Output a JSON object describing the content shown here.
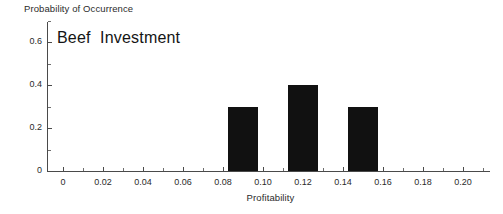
{
  "chart_data": {
    "type": "bar",
    "title": "Beef  Investment",
    "xlabel": "Profitability",
    "ylabel": "Probability of Occurrence",
    "x": [
      0.09,
      0.12,
      0.15
    ],
    "values": [
      0.3,
      0.4,
      0.3
    ],
    "bar_width": 0.0075,
    "xlim": [
      -0.008,
      0.2135
    ],
    "ylim": [
      0,
      0.7
    ],
    "grid": false,
    "legend": null,
    "bar_color": "#111111",
    "axis_color": "#4a4a4a",
    "x_ticks": [
      {
        "value": 0,
        "label": "0",
        "major": true
      },
      {
        "value": 0.01,
        "label": "",
        "major": false
      },
      {
        "value": 0.02,
        "label": "0.02",
        "major": true
      },
      {
        "value": 0.03,
        "label": "",
        "major": false
      },
      {
        "value": 0.04,
        "label": "0.04",
        "major": true
      },
      {
        "value": 0.05,
        "label": "",
        "major": false
      },
      {
        "value": 0.06,
        "label": "0.06",
        "major": true
      },
      {
        "value": 0.07,
        "label": "",
        "major": false
      },
      {
        "value": 0.08,
        "label": "0.08",
        "major": true
      },
      {
        "value": 0.09,
        "label": "",
        "major": false
      },
      {
        "value": 0.1,
        "label": "0.10",
        "major": true
      },
      {
        "value": 0.11,
        "label": "",
        "major": false
      },
      {
        "value": 0.12,
        "label": "0.12",
        "major": true
      },
      {
        "value": 0.13,
        "label": "",
        "major": false
      },
      {
        "value": 0.14,
        "label": "0.14",
        "major": true
      },
      {
        "value": 0.15,
        "label": "",
        "major": false
      },
      {
        "value": 0.16,
        "label": "0.16",
        "major": true
      },
      {
        "value": 0.17,
        "label": "",
        "major": false
      },
      {
        "value": 0.18,
        "label": "0.18",
        "major": true
      },
      {
        "value": 0.19,
        "label": "",
        "major": false
      },
      {
        "value": 0.2,
        "label": "0.20",
        "major": true
      },
      {
        "value": 0.21,
        "label": "",
        "major": false
      }
    ],
    "y_ticks": [
      {
        "value": 0,
        "label": "0",
        "major": true
      },
      {
        "value": 0.1,
        "label": "",
        "major": false
      },
      {
        "value": 0.2,
        "label": "0.2",
        "major": true
      },
      {
        "value": 0.3,
        "label": "",
        "major": false
      },
      {
        "value": 0.4,
        "label": "0.4",
        "major": true
      },
      {
        "value": 0.5,
        "label": "",
        "major": false
      },
      {
        "value": 0.6,
        "label": "0.6",
        "major": true
      },
      {
        "value": 0.7,
        "label": "",
        "major": false
      }
    ]
  }
}
